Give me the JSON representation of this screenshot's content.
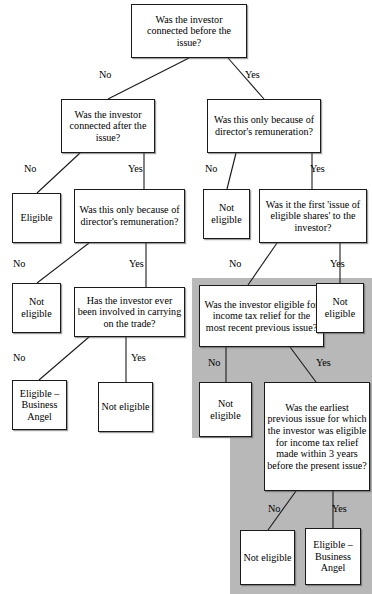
{
  "diagram": {
    "colors": {
      "shade": "#b8b8b8",
      "box_border": "#1a1a1a",
      "box_fill": "#ffffff",
      "text": "#000000"
    },
    "nodes": [
      {
        "id": "q1",
        "label": "Was the investor connected before the issue?",
        "kind": "question",
        "x": 131,
        "y": 4,
        "w": 116,
        "h": 54
      },
      {
        "id": "q2",
        "label": "Was the investor connected after the issue?",
        "kind": "question",
        "x": 61,
        "y": 99,
        "w": 94,
        "h": 54
      },
      {
        "id": "q3",
        "label": "Was this only because of director's remuneration?",
        "kind": "question",
        "x": 207,
        "y": 99,
        "w": 114,
        "h": 54
      },
      {
        "id": "r1",
        "label": "Eligible",
        "kind": "outcome",
        "x": 12,
        "y": 193,
        "w": 49,
        "h": 50
      },
      {
        "id": "q4",
        "label": "Was this only because of director's remuneration?",
        "kind": "question",
        "x": 74,
        "y": 189,
        "w": 111,
        "h": 54
      },
      {
        "id": "r2",
        "label": "Not eligible",
        "kind": "outcome",
        "x": 203,
        "y": 189,
        "w": 47,
        "h": 50
      },
      {
        "id": "q5",
        "label": "Was it the first 'issue of eligible shares' to the investor?",
        "kind": "question",
        "x": 259,
        "y": 189,
        "w": 108,
        "h": 54
      },
      {
        "id": "r3",
        "label": "Not eligible",
        "kind": "outcome",
        "x": 12,
        "y": 283,
        "w": 49,
        "h": 50
      },
      {
        "id": "q6",
        "label": "Has the investor ever been involved in carrying on the trade?",
        "kind": "question",
        "x": 74,
        "y": 287,
        "w": 111,
        "h": 50
      },
      {
        "id": "q7",
        "label": "Was the investor eligible for income tax relief for the most recent previous issue?",
        "kind": "question",
        "x": 199,
        "y": 285,
        "w": 125,
        "h": 62
      },
      {
        "id": "r4",
        "label": "Not eligible",
        "kind": "outcome",
        "x": 316,
        "y": 283,
        "w": 48,
        "h": 50
      },
      {
        "id": "r5",
        "label": "Eligible – Business Angel",
        "kind": "outcome",
        "x": 12,
        "y": 380,
        "w": 55,
        "h": 50
      },
      {
        "id": "r6",
        "label": "Not eligible",
        "kind": "outcome",
        "x": 98,
        "y": 382,
        "w": 55,
        "h": 50
      },
      {
        "id": "r7",
        "label": "Not eligible",
        "kind": "outcome",
        "x": 199,
        "y": 382,
        "w": 53,
        "h": 55
      },
      {
        "id": "q8",
        "label": "Was the earliest previous issue for which the investor was eligible for income tax relief made within 3 years before the present issue?",
        "kind": "question",
        "x": 264,
        "y": 382,
        "w": 106,
        "h": 109
      },
      {
        "id": "r8",
        "label": "Not eligible",
        "kind": "outcome",
        "x": 240,
        "y": 530,
        "w": 55,
        "h": 55
      },
      {
        "id": "r9",
        "label": "Eligible – Business Angel",
        "kind": "outcome",
        "x": 305,
        "y": 528,
        "w": 56,
        "h": 57
      }
    ],
    "edge_labels": [
      {
        "id": "e1",
        "text": "No",
        "x": 99,
        "y": 69
      },
      {
        "id": "e2",
        "text": "Yes",
        "x": 245,
        "y": 69
      },
      {
        "id": "e3",
        "text": "No",
        "x": 24,
        "y": 163
      },
      {
        "id": "e4",
        "text": "Yes",
        "x": 128,
        "y": 163
      },
      {
        "id": "e5",
        "text": "No",
        "x": 205,
        "y": 163
      },
      {
        "id": "e6",
        "text": "Yes",
        "x": 310,
        "y": 163
      },
      {
        "id": "e7",
        "text": "No",
        "x": 13,
        "y": 258
      },
      {
        "id": "e8",
        "text": "Yes",
        "x": 129,
        "y": 258
      },
      {
        "id": "e9",
        "text": "No",
        "x": 229,
        "y": 258
      },
      {
        "id": "e10",
        "text": "Yes",
        "x": 330,
        "y": 258
      },
      {
        "id": "e11",
        "text": "No",
        "x": 13,
        "y": 352
      },
      {
        "id": "e12",
        "text": "Yes",
        "x": 131,
        "y": 352
      },
      {
        "id": "e13",
        "text": "No",
        "x": 208,
        "y": 357
      },
      {
        "id": "e14",
        "text": "Yes",
        "x": 316,
        "y": 357
      },
      {
        "id": "e15",
        "text": "No",
        "x": 268,
        "y": 503
      },
      {
        "id": "e16",
        "text": "Yes",
        "x": 332,
        "y": 503
      }
    ],
    "shaded_regions": [
      {
        "id": "shade-upper",
        "x": 192,
        "y": 278,
        "w": 180,
        "h": 160
      },
      {
        "id": "shade-lower",
        "x": 230,
        "y": 438,
        "w": 142,
        "h": 155
      }
    ],
    "connectors": [
      {
        "id": "c1",
        "from": "q1",
        "to": "q2",
        "points": "189,58 108,99"
      },
      {
        "id": "c2",
        "from": "q1",
        "to": "q3",
        "points": "228,58 264,99"
      },
      {
        "id": "c3",
        "from": "q2",
        "to": "r1",
        "points": "80,153 37,193"
      },
      {
        "id": "c4",
        "from": "q2",
        "to": "q4",
        "points": "144,153 144,189"
      },
      {
        "id": "c5",
        "from": "q3",
        "to": "r2",
        "points": "236,153 227,189"
      },
      {
        "id": "c6",
        "from": "q3",
        "to": "q5",
        "points": "312,153 312,189"
      },
      {
        "id": "c7",
        "from": "q4",
        "to": "r3",
        "points": "89,243 37,283"
      },
      {
        "id": "c8",
        "from": "q4",
        "to": "q6",
        "points": "146,243 146,287"
      },
      {
        "id": "c9",
        "from": "q5",
        "to": "q7",
        "points": "277,243 248,285"
      },
      {
        "id": "c10",
        "from": "q5",
        "to": "r4",
        "points": "340,243 340,283"
      },
      {
        "id": "c11",
        "from": "q6",
        "to": "r5",
        "points": "89,337 39,380"
      },
      {
        "id": "c12",
        "from": "q6",
        "to": "r6",
        "points": "126,337 126,382"
      },
      {
        "id": "c13",
        "from": "q7",
        "to": "r7",
        "points": "226,347 226,382"
      },
      {
        "id": "c14",
        "from": "q7",
        "to": "q8",
        "points": "290,347 316,382"
      },
      {
        "id": "c15",
        "from": "q8",
        "to": "r8",
        "points": "296,491 268,530"
      },
      {
        "id": "c16",
        "from": "q8",
        "to": "r9",
        "points": "333,491 333,528"
      }
    ]
  }
}
